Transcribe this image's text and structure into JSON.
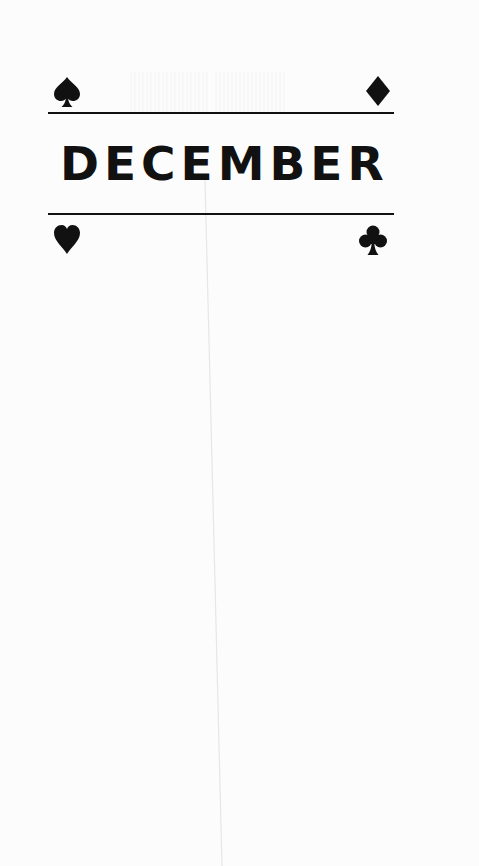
{
  "page": {
    "title": "DECEMBER",
    "colors": {
      "ink": "#111111",
      "paper": "#fcfcfc"
    },
    "suits": {
      "top_left": "spade-icon",
      "top_right": "diamond-icon",
      "bottom_left": "heart-icon",
      "bottom_right": "club-icon"
    }
  }
}
